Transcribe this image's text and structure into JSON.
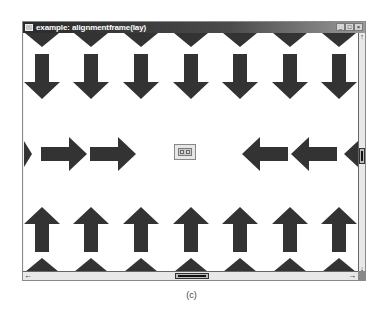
{
  "window": {
    "title": "example: alignmentframe(lay)",
    "buttons": {
      "minimize": "_",
      "maximize": "□",
      "close": "×"
    }
  },
  "scrollbars": {
    "vertical": {
      "up_arrow": "↑",
      "down_arrow": "↓"
    },
    "horizontal": {
      "left_arrow": "←",
      "right_arrow": "→"
    }
  },
  "canvas": {
    "arrow_color": "#333333",
    "top_triangles": 7,
    "down_arrows": 7,
    "right_arrows": 3,
    "left_arrows": 3,
    "up_arrows": 7,
    "bottom_triangles": 7
  },
  "caption": "(c)"
}
